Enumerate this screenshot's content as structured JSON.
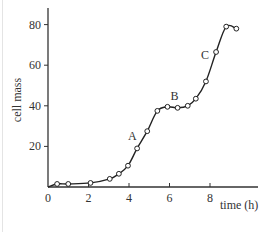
{
  "chart_data": {
    "type": "line",
    "title": "",
    "xlabel": "time (h)",
    "ylabel": "cell mass",
    "xlim": [
      0,
      10.2
    ],
    "ylim": [
      0,
      90
    ],
    "xticks": [
      0,
      2,
      4,
      6,
      8
    ],
    "yticks": [
      20,
      40,
      60,
      80
    ],
    "grid": false,
    "legend": null,
    "series": [
      {
        "name": "cell mass",
        "marker": "open-circle",
        "x": [
          0.45,
          1.0,
          2.1,
          3.05,
          3.5,
          3.95,
          4.4,
          4.9,
          5.4,
          5.9,
          6.4,
          6.9,
          7.3,
          7.8,
          8.3,
          8.8,
          9.3
        ],
        "y": [
          1.5,
          1.5,
          2,
          4,
          6.5,
          10.5,
          19,
          27.5,
          37.5,
          39.5,
          39,
          40,
          43.5,
          52,
          66.5,
          79,
          78
        ]
      }
    ],
    "curve_start": [
      0,
      0
    ],
    "annotations": [
      {
        "text": "A",
        "x": 4.2,
        "y": 25
      },
      {
        "text": "B",
        "x": 6.3,
        "y": 45
      },
      {
        "text": "C",
        "x": 7.8,
        "y": 65
      }
    ]
  }
}
